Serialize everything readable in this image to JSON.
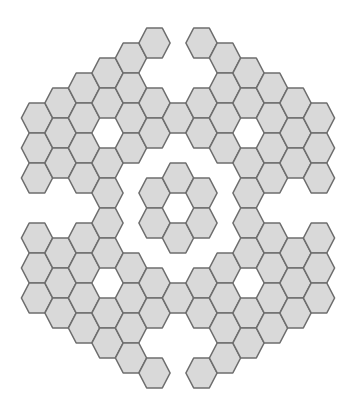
{
  "style": {
    "fill": "#d9d9d9",
    "stroke": "#6e6e6e",
    "background": "#ffffff"
  },
  "grid": {
    "orientation": "flat-top",
    "origin_x": 178,
    "column_spacing": 23.5,
    "row_spacing": 30,
    "hex_radius_x": 15.6,
    "hex_half_height": 15,
    "columns": [
      {
        "col": -6,
        "rows_y": [
          118,
          148,
          178,
          238,
          268,
          298
        ]
      },
      {
        "col": -5,
        "rows_y": [
          103,
          133,
          163,
          253,
          283,
          313
        ]
      },
      {
        "col": -4,
        "rows_y": [
          88,
          118,
          148,
          178,
          238,
          268,
          298,
          328
        ]
      },
      {
        "col": -3,
        "rows_y": [
          73,
          103,
          163,
          193,
          223,
          253,
          313,
          343
        ]
      },
      {
        "col": -2,
        "rows_y": [
          58,
          88,
          118,
          148,
          268,
          298,
          328,
          358
        ]
      },
      {
        "col": -1,
        "rows_y": [
          43,
          103,
          133,
          193,
          223,
          283,
          313,
          373
        ]
      },
      {
        "col": 0,
        "rows_y": [
          118,
          178,
          238,
          298
        ]
      },
      {
        "col": 1,
        "rows_y": [
          43,
          103,
          133,
          193,
          223,
          283,
          313,
          373
        ]
      },
      {
        "col": 2,
        "rows_y": [
          58,
          88,
          118,
          148,
          268,
          298,
          328,
          358
        ]
      },
      {
        "col": 3,
        "rows_y": [
          73,
          103,
          163,
          193,
          223,
          253,
          313,
          343
        ]
      },
      {
        "col": 4,
        "rows_y": [
          88,
          118,
          148,
          178,
          238,
          268,
          298,
          328
        ]
      },
      {
        "col": 5,
        "rows_y": [
          103,
          133,
          163,
          253,
          283,
          313
        ]
      },
      {
        "col": 6,
        "rows_y": [
          118,
          148,
          178,
          238,
          268,
          298
        ]
      }
    ]
  }
}
